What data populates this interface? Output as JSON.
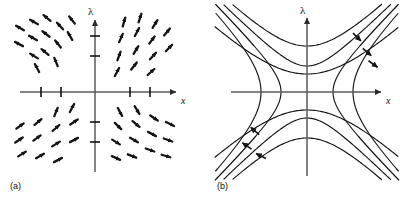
{
  "figure": {
    "background": "#ffffff",
    "ink_color": "#1a1a1a",
    "axis_color": "#2b2b2b",
    "width": 402,
    "height": 199
  },
  "panels": [
    {
      "id": "a",
      "caption": "(a)",
      "kind": "vector-field",
      "origin": {
        "x": 95,
        "y": 92
      },
      "axes": {
        "horizontal_label": "x",
        "vertical_label": "λ",
        "x_axis_y": 92,
        "y_axis_x": 95,
        "x_start": 20,
        "x_end": 178,
        "y_start": 18,
        "y_end": 172,
        "x_label_pos": {
          "x": 181,
          "y": 102
        },
        "lambda_label_pos": {
          "x": 88,
          "y": 14
        }
      },
      "fixed_point_ticks": {
        "note": "short cross-bars marking equilibria on each axis",
        "on_x_axis": [
          41,
          61,
          130,
          150
        ],
        "on_lambda_axis": [
          36,
          56,
          122,
          142
        ],
        "tick_half_length": 4
      },
      "arrow_field": {
        "arrow_length": 9,
        "quadrants": [
          {
            "name": "upper-left",
            "direction_deg": 145,
            "description": "arrows point up and to the left"
          },
          {
            "name": "upper-right",
            "direction_deg": 55,
            "description": "arrows point up and to the right"
          },
          {
            "name": "lower-left",
            "direction_deg": 35,
            "description": "arrows point up and to the right"
          },
          {
            "name": "lower-right",
            "direction_deg": -20,
            "description": "arrows point down and to the right"
          }
        ],
        "arrows": [
          {
            "x": 20,
            "y": 28,
            "angle": 150
          },
          {
            "x": 34,
            "y": 22,
            "angle": 150
          },
          {
            "x": 19,
            "y": 44,
            "angle": 152
          },
          {
            "x": 33,
            "y": 38,
            "angle": 150
          },
          {
            "x": 47,
            "y": 18,
            "angle": 140
          },
          {
            "x": 46,
            "y": 34,
            "angle": 142
          },
          {
            "x": 60,
            "y": 26,
            "angle": 132
          },
          {
            "x": 45,
            "y": 52,
            "angle": 140
          },
          {
            "x": 34,
            "y": 56,
            "angle": 148
          },
          {
            "x": 58,
            "y": 44,
            "angle": 128
          },
          {
            "x": 37,
            "y": 68,
            "angle": 118
          },
          {
            "x": 56,
            "y": 62,
            "angle": 112
          },
          {
            "x": 70,
            "y": 36,
            "angle": 120
          },
          {
            "x": 72,
            "y": 20,
            "angle": 128
          },
          {
            "x": 124,
            "y": 22,
            "angle": 74
          },
          {
            "x": 140,
            "y": 18,
            "angle": 72
          },
          {
            "x": 121,
            "y": 38,
            "angle": 66
          },
          {
            "x": 137,
            "y": 32,
            "angle": 62
          },
          {
            "x": 155,
            "y": 24,
            "angle": 58
          },
          {
            "x": 152,
            "y": 40,
            "angle": 54
          },
          {
            "x": 167,
            "y": 32,
            "angle": 50
          },
          {
            "x": 169,
            "y": 48,
            "angle": 46
          },
          {
            "x": 153,
            "y": 56,
            "angle": 48
          },
          {
            "x": 136,
            "y": 50,
            "angle": 58
          },
          {
            "x": 119,
            "y": 56,
            "angle": 70
          },
          {
            "x": 134,
            "y": 66,
            "angle": 52
          },
          {
            "x": 151,
            "y": 72,
            "angle": 42
          },
          {
            "x": 117,
            "y": 72,
            "angle": 62
          },
          {
            "x": 56,
            "y": 112,
            "angle": 68
          },
          {
            "x": 72,
            "y": 108,
            "angle": 62
          },
          {
            "x": 20,
            "y": 126,
            "angle": 36
          },
          {
            "x": 38,
            "y": 122,
            "angle": 40
          },
          {
            "x": 56,
            "y": 128,
            "angle": 42
          },
          {
            "x": 74,
            "y": 122,
            "angle": 34
          },
          {
            "x": 19,
            "y": 140,
            "angle": 34
          },
          {
            "x": 37,
            "y": 138,
            "angle": 36
          },
          {
            "x": 56,
            "y": 144,
            "angle": 32
          },
          {
            "x": 74,
            "y": 140,
            "angle": 28
          },
          {
            "x": 22,
            "y": 154,
            "angle": 32
          },
          {
            "x": 40,
            "y": 156,
            "angle": 30
          },
          {
            "x": 58,
            "y": 160,
            "angle": 28
          },
          {
            "x": 120,
            "y": 112,
            "angle": -62
          },
          {
            "x": 137,
            "y": 110,
            "angle": -58
          },
          {
            "x": 118,
            "y": 126,
            "angle": -44
          },
          {
            "x": 136,
            "y": 124,
            "angle": -40
          },
          {
            "x": 154,
            "y": 118,
            "angle": -34
          },
          {
            "x": 170,
            "y": 124,
            "angle": -26
          },
          {
            "x": 152,
            "y": 134,
            "angle": -28
          },
          {
            "x": 134,
            "y": 140,
            "angle": -30
          },
          {
            "x": 116,
            "y": 142,
            "angle": -32
          },
          {
            "x": 168,
            "y": 140,
            "angle": -20
          },
          {
            "x": 150,
            "y": 150,
            "angle": -20
          },
          {
            "x": 132,
            "y": 156,
            "angle": -22
          },
          {
            "x": 116,
            "y": 158,
            "angle": -24
          },
          {
            "x": 166,
            "y": 156,
            "angle": -16
          }
        ]
      }
    },
    {
      "id": "b",
      "caption": "(b)",
      "kind": "phase-portrait",
      "origin": {
        "x": 106,
        "y": 92
      },
      "axes": {
        "horizontal_label": "x",
        "vertical_label": "λ",
        "x_axis_y": 92,
        "y_axis_x": 106,
        "x_start": 30,
        "x_end": 182,
        "y_start": 16,
        "y_end": 176,
        "x_label_pos": {
          "x": 185,
          "y": 102
        },
        "lambda_label_pos": {
          "x": 98,
          "y": 13
        }
      },
      "trajectories": {
        "description": "hyperbolic family lambda^2 - x^2 = c, saddle-node / transcritical style separatrices through the origin",
        "count": 8,
        "levels": [
          26,
          46,
          66,
          -26,
          -46,
          -66
        ],
        "flow_direction": "up and to the right in the upper-right region; down and to the left in the lower-left region"
      },
      "flow_arrows": [
        {
          "x": 156,
          "y": 37,
          "angle": -44,
          "label": "upper-right-outer"
        },
        {
          "x": 166,
          "y": 52,
          "angle": -40,
          "label": "upper-right-middle"
        },
        {
          "x": 172,
          "y": 64,
          "angle": -36,
          "label": "upper-right-inner"
        },
        {
          "x": 54,
          "y": 131,
          "angle": 140,
          "label": "lower-left-outer"
        },
        {
          "x": 46,
          "y": 146,
          "angle": 146,
          "label": "lower-left-middle"
        },
        {
          "x": 60,
          "y": 156,
          "angle": 152,
          "label": "lower-left-inner"
        }
      ]
    }
  ]
}
